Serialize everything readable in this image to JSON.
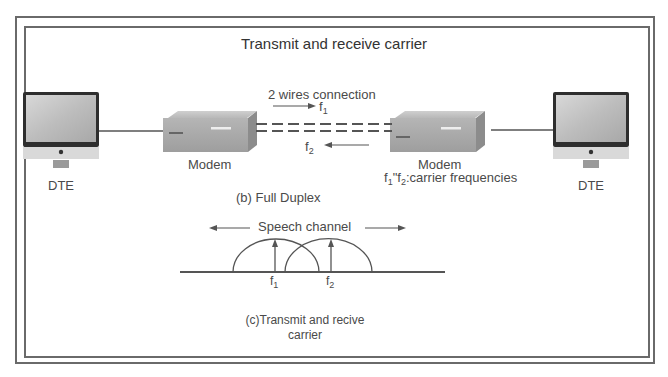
{
  "title": "Transmit and receive carrier",
  "full_duplex": {
    "connection_label": "2 wires connection",
    "forward_freq": {
      "base": "f",
      "sub": "1"
    },
    "reverse_freq": {
      "base": "f",
      "sub": "2"
    },
    "left_dte_label": "DTE",
    "left_modem_label": "Modem",
    "right_modem_label": "Modem",
    "carrier_note": {
      "f1": "f",
      "s1": "1",
      "sep": "\"f",
      "s2": "2",
      "rest": ":carrier frequencies"
    },
    "right_dte_label": "DTE",
    "caption": "(b) Full Duplex"
  },
  "carrier_plot": {
    "channel_label": "Speech channel",
    "f1": {
      "base": "f",
      "sub": "1"
    },
    "f2": {
      "base": "f",
      "sub": "2"
    },
    "caption_line1": "(c)Transmit and recive",
    "caption_line2": "carrier"
  },
  "colors": {
    "line": "#555555",
    "frame": "#6a6a6a",
    "text": "#4a4a4a"
  }
}
